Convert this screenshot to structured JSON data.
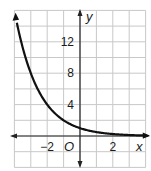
{
  "chart_data": {
    "type": "line",
    "title": "",
    "xlabel": "x",
    "ylabel": "y",
    "origin_label": "O",
    "xlim": [
      -4,
      4
    ],
    "ylim": [
      -4,
      16
    ],
    "x_grid_step": 1,
    "y_grid_step": 2,
    "grid": true,
    "x_ticks": [
      {
        "value": -2,
        "label": "−2"
      },
      {
        "value": 2,
        "label": "2"
      }
    ],
    "y_ticks": [
      {
        "value": 4,
        "label": "4"
      },
      {
        "value": 8,
        "label": "8"
      },
      {
        "value": 12,
        "label": "12"
      }
    ],
    "series": [
      {
        "name": "f(x) = (1/2)^x",
        "color": "#111111",
        "x": [
          -3.9,
          -3.5,
          -3,
          -2.5,
          -2,
          -1.5,
          -1,
          -0.5,
          0,
          0.5,
          1,
          1.5,
          2,
          2.5,
          3,
          3.5
        ],
        "values": [
          14.93,
          11.31,
          8,
          5.66,
          4,
          2.83,
          2,
          1.41,
          1,
          0.71,
          0.5,
          0.35,
          0.25,
          0.18,
          0.125,
          0.09
        ]
      }
    ]
  },
  "colors": {
    "grid": "#c8c8c8",
    "axis": "#222222",
    "curve": "#111111"
  }
}
